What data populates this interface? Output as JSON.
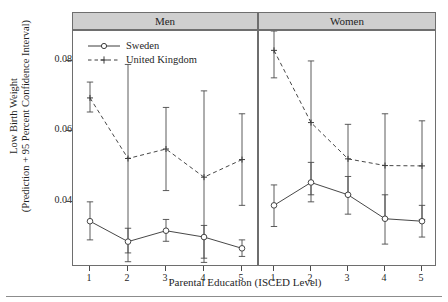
{
  "figure": {
    "ylabel": "Low Birth Weight\n(Prediction + 95 Percent Confidence Interval)",
    "xlabel": "Parental Education (ISCED Level)",
    "panel_men": "Men",
    "panel_women": "Women",
    "legend": [
      {
        "label": "Sweden",
        "style": "solid-circle",
        "color": "#3d3d3d"
      },
      {
        "label": "United Kingdom",
        "style": "dashed-plus",
        "color": "#3d3d3d"
      }
    ],
    "ytick_labels": [
      "0.04",
      "0.06",
      "0.08"
    ],
    "xtick_labels": [
      "1",
      "2",
      "3",
      "4",
      "5"
    ]
  },
  "chart_data": {
    "type": "line",
    "title": "",
    "xlabel": "Parental Education (ISCED Level)",
    "ylabel": "Low Birth Weight (Prediction + 95 Percent Confidence Interval)",
    "x": [
      1,
      2,
      3,
      4,
      5
    ],
    "ylim": [
      0.0215,
      0.0885
    ],
    "yticks": [
      0.04,
      0.06,
      0.08
    ],
    "grid": false,
    "legend_position": "top-left",
    "error_bars": "95% confidence interval",
    "panels": [
      {
        "name": "Men",
        "series": [
          {
            "name": "Sweden",
            "style": "solid",
            "marker": "circle",
            "values": [
              0.0345,
              0.0287,
              0.0318,
              0.03,
              0.0268
            ],
            "ci_lower": [
              0.0292,
              0.023,
              0.0288,
              0.024,
              0.0245
            ],
            "ci_upper": [
              0.04,
              0.0325,
              0.035,
              0.0333,
              0.0292
            ]
          },
          {
            "name": "United Kingdom",
            "style": "dashed",
            "marker": "plus",
            "values": [
              0.0695,
              0.0523,
              0.055,
              0.047,
              0.052
            ],
            "ci_lower": [
              0.0655,
              0.0255,
              0.0432,
              0.0228,
              0.039
            ],
            "ci_upper": [
              0.074,
              0.079,
              0.0668,
              0.0715,
              0.065
            ]
          }
        ]
      },
      {
        "name": "Women",
        "series": [
          {
            "name": "Sweden",
            "style": "solid",
            "marker": "circle",
            "values": [
              0.039,
              0.0455,
              0.042,
              0.0352,
              0.0345
            ],
            "ci_lower": [
              0.033,
              0.04,
              0.0365,
              0.028,
              0.03
            ],
            "ci_upper": [
              0.0448,
              0.0512,
              0.0472,
              0.042,
              0.039
            ]
          },
          {
            "name": "United Kingdom",
            "style": "dashed",
            "marker": "plus",
            "values": [
              0.083,
              0.0625,
              0.0522,
              0.0503,
              0.0502
            ],
            "ci_lower": [
              0.0752,
              0.042,
              0.042,
              0.0352,
              0.035
            ],
            "ci_upper": [
              0.0885,
              0.08,
              0.062,
              0.065,
              0.063
            ]
          }
        ]
      }
    ]
  }
}
